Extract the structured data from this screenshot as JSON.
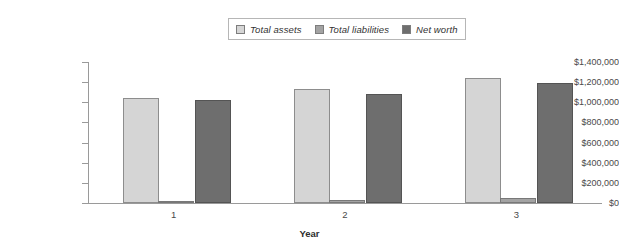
{
  "chart_data": {
    "type": "bar",
    "title": "",
    "xlabel": "Year",
    "ylabel": "",
    "categories": [
      "1",
      "2",
      "3"
    ],
    "series": [
      {
        "name": "Total assets",
        "color": "#d5d5d5",
        "values": [
          1040000,
          1130000,
          1240000
        ]
      },
      {
        "name": "Total liabilities",
        "color": "#a3a3a3",
        "values": [
          5000,
          25000,
          45000
        ]
      },
      {
        "name": "Net worth",
        "color": "#6e6e6e",
        "values": [
          1020000,
          1085000,
          1195000
        ]
      }
    ],
    "ylim": [
      0,
      1400000
    ],
    "ytick_values": [
      0,
      200000,
      400000,
      600000,
      800000,
      1000000,
      1200000,
      1400000
    ],
    "ytick_labels": [
      "$0",
      "$200,000",
      "$400,000",
      "$600,000",
      "$800,000",
      "$1,000,000",
      "$1,200,000",
      "$1,400,000"
    ],
    "grid": false,
    "legend_position": "top-center"
  },
  "legend": {
    "entries": [
      {
        "label": "Total assets"
      },
      {
        "label": "Total liabilities"
      },
      {
        "label": "Net worth"
      }
    ]
  },
  "axes": {
    "x_title": "Year"
  }
}
